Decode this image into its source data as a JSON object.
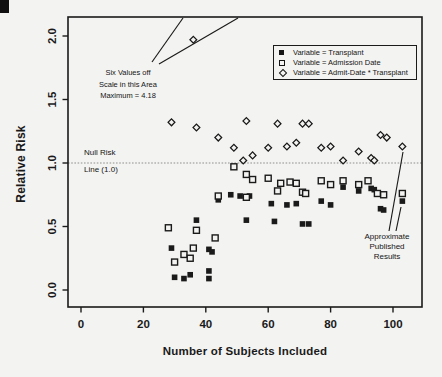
{
  "figure": {
    "background": "#f3f3f1",
    "ink": "#1a1a1a",
    "null_line_color": "#8f8f8d"
  },
  "y_axis": {
    "label": "Relative Risk",
    "ticks": [
      {
        "label": "2.0",
        "value": 2.0
      },
      {
        "label": "1.5",
        "value": 1.5
      },
      {
        "label": "1.0",
        "value": 1.0
      },
      {
        "label": "0.5",
        "value": 0.5
      },
      {
        "label": "0.0",
        "value": 0.0
      }
    ]
  },
  "x_axis": {
    "label": "Number of Subjects Included",
    "ticks": [
      {
        "label": "0",
        "value": 0
      },
      {
        "label": "20",
        "value": 20
      },
      {
        "label": "40",
        "value": 40
      },
      {
        "label": "60",
        "value": 60
      },
      {
        "label": "80",
        "value": 80
      },
      {
        "label": "100",
        "value": 100
      }
    ]
  },
  "legend": {
    "items": [
      {
        "marker": "filled-square",
        "label": "Variable = Transplant"
      },
      {
        "marker": "open-square",
        "label": "Variable = Admission Date"
      },
      {
        "marker": "open-diamond",
        "label": "Variable = Admit-Date * Transplant"
      }
    ]
  },
  "annotations": {
    "off_scale": {
      "lines": [
        "Six Values off",
        "Scale in this Area",
        "Maximum = 4.18"
      ]
    },
    "null_risk": {
      "line1": "Null Risk",
      "line2": "Line (1.0)"
    },
    "published": {
      "lines": [
        "Approximate",
        "Published",
        "Results"
      ]
    }
  },
  "chart_data": {
    "type": "scatter",
    "xlabel": "Number of Subjects Included",
    "ylabel": "Relative Risk",
    "xlim": [
      -4,
      109
    ],
    "ylim": [
      -0.13,
      2.15
    ],
    "null_line_y": 1.0,
    "grid": false,
    "legend_position": "top-right",
    "off_scale": {
      "series": "Variable = Admit-Date * Transplant",
      "count": 6,
      "maximum": 4.18
    },
    "series": [
      {
        "name": "Variable = Transplant",
        "marker": "filled-square",
        "points": [
          [
            29,
            0.33
          ],
          [
            30,
            0.1
          ],
          [
            33,
            0.09
          ],
          [
            35,
            0.12
          ],
          [
            37,
            0.55
          ],
          [
            41,
            0.32
          ],
          [
            41,
            0.15
          ],
          [
            41,
            0.09
          ],
          [
            42,
            0.3
          ],
          [
            44,
            0.71
          ],
          [
            48,
            0.75
          ],
          [
            51,
            0.74
          ],
          [
            53,
            0.55
          ],
          [
            54,
            0.74
          ],
          [
            61,
            0.68
          ],
          [
            62,
            0.54
          ],
          [
            66,
            0.67
          ],
          [
            69,
            0.68
          ],
          [
            71,
            0.52
          ],
          [
            73,
            0.52
          ],
          [
            77,
            0.7
          ],
          [
            80,
            0.67
          ],
          [
            84,
            0.81
          ],
          [
            89,
            0.78
          ],
          [
            93,
            0.8
          ],
          [
            94,
            0.79
          ],
          [
            96,
            0.64
          ],
          [
            97,
            0.63
          ],
          [
            103,
            0.7
          ]
        ]
      },
      {
        "name": "Variable = Admission Date",
        "marker": "open-square",
        "points": [
          [
            28,
            0.49
          ],
          [
            30,
            0.22
          ],
          [
            33,
            0.28
          ],
          [
            35,
            0.25
          ],
          [
            36,
            0.33
          ],
          [
            37,
            0.47
          ],
          [
            43,
            0.41
          ],
          [
            44,
            0.74
          ],
          [
            49,
            0.97
          ],
          [
            53,
            0.91
          ],
          [
            53,
            0.73
          ],
          [
            55,
            0.87
          ],
          [
            60,
            0.88
          ],
          [
            63,
            0.78
          ],
          [
            64,
            0.84
          ],
          [
            67,
            0.85
          ],
          [
            69,
            0.84
          ],
          [
            71,
            0.77
          ],
          [
            72,
            0.76
          ],
          [
            77,
            0.86
          ],
          [
            80,
            0.83
          ],
          [
            84,
            0.86
          ],
          [
            89,
            0.83
          ],
          [
            92,
            0.86
          ],
          [
            95,
            0.76
          ],
          [
            97,
            0.75
          ],
          [
            103,
            0.76
          ]
        ]
      },
      {
        "name": "Variable = Admit-Date * Transplant",
        "marker": "open-diamond",
        "points": [
          [
            29,
            1.32
          ],
          [
            36,
            1.97
          ],
          [
            37,
            1.28
          ],
          [
            44,
            1.2
          ],
          [
            49,
            1.12
          ],
          [
            52,
            1.02
          ],
          [
            53,
            1.33
          ],
          [
            55,
            1.06
          ],
          [
            60,
            1.12
          ],
          [
            63,
            1.31
          ],
          [
            66,
            1.13
          ],
          [
            69,
            1.16
          ],
          [
            71,
            1.31
          ],
          [
            73,
            1.31
          ],
          [
            77,
            1.12
          ],
          [
            80,
            1.13
          ],
          [
            84,
            1.02
          ],
          [
            89,
            1.09
          ],
          [
            93,
            1.04
          ],
          [
            94,
            1.02
          ],
          [
            96,
            1.22
          ],
          [
            98,
            1.2
          ],
          [
            103,
            1.13
          ]
        ]
      }
    ]
  }
}
